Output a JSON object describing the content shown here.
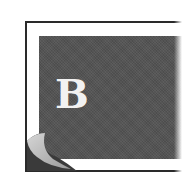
{
  "icon": {
    "semantic": "book-page-curl-icon",
    "letter": "B",
    "colors": {
      "panel": "#545454",
      "border": "#2a2a2a",
      "letter": "#f2f2f2",
      "curl_light": "#bdbdbd",
      "curl_shadow": "#3a3a3a"
    }
  }
}
